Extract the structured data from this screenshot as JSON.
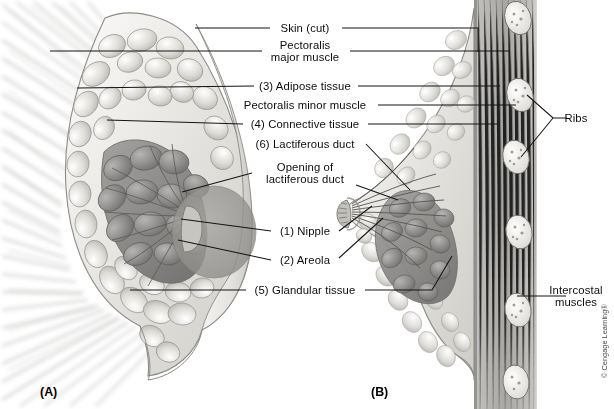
{
  "figure": {
    "copyright": "© Cengage Learning®"
  },
  "panels": [
    {
      "id": "A",
      "caption": "(A)",
      "view": "anterior-dissection",
      "x": 40,
      "y": 385
    },
    {
      "id": "B",
      "caption": "(B)",
      "view": "sagittal-section",
      "x": 371,
      "y": 385
    }
  ],
  "labels": [
    {
      "key": "skin",
      "text": "Skin (cut)",
      "lines": [
        "Skin (cut)"
      ],
      "cx": 305,
      "cy": 28,
      "w": 64,
      "number": ""
    },
    {
      "key": "pectoralis_major",
      "text": "Pectoralis major muscle",
      "lines": [
        "Pectoralis",
        "major muscle"
      ],
      "cx": 305,
      "cy": 51,
      "w": 84,
      "number": ""
    },
    {
      "key": "adipose",
      "text": "(3) Adipose tissue",
      "lines": [
        "(3) Adipose tissue"
      ],
      "cx": 305,
      "cy": 86,
      "w": 102,
      "number": "3"
    },
    {
      "key": "pectoralis_minor",
      "text": "Pectoralis minor muscle",
      "lines": [
        "Pectoralis minor muscle"
      ],
      "cx": 305,
      "cy": 105,
      "w": 140,
      "number": ""
    },
    {
      "key": "connective",
      "text": "(4) Connective tissue",
      "lines": [
        "(4) Connective tissue"
      ],
      "cx": 305,
      "cy": 124,
      "w": 124,
      "number": "4"
    },
    {
      "key": "lactiferous_duct",
      "text": "(6) Lactiferous duct",
      "lines": [
        "(6) Lactiferous duct"
      ],
      "cx": 305,
      "cy": 144,
      "w": 118,
      "number": "6"
    },
    {
      "key": "duct_opening",
      "text": "Opening of lactiferous duct",
      "lines": [
        "Opening of",
        "lactiferous duct"
      ],
      "cx": 305,
      "cy": 173,
      "w": 98,
      "number": ""
    },
    {
      "key": "nipple",
      "text": "(1) Nipple",
      "lines": [
        "(1) Nipple"
      ],
      "cx": 305,
      "cy": 231,
      "w": 62,
      "number": "1"
    },
    {
      "key": "areola",
      "text": "(2) Areola",
      "lines": [
        "(2) Areola"
      ],
      "cx": 305,
      "cy": 260,
      "w": 62,
      "number": "2"
    },
    {
      "key": "glandular",
      "text": "(5) Glandular tissue",
      "lines": [
        "(5) Glandular tissue"
      ],
      "cx": 305,
      "cy": 290,
      "w": 116,
      "number": "5"
    },
    {
      "key": "ribs",
      "text": "Ribs",
      "lines": [
        "Ribs"
      ],
      "cx": 576,
      "cy": 118,
      "w": 28,
      "number": ""
    },
    {
      "key": "intercostal",
      "text": "Intercostal muscles",
      "lines": [
        "Intercostal",
        "muscles"
      ],
      "cx": 576,
      "cy": 296,
      "w": 58,
      "number": ""
    }
  ],
  "leaders": [
    {
      "label": "skin",
      "side": "left",
      "path": "M 195,28 L 270,28"
    },
    {
      "label": "skin",
      "side": "right",
      "path": "M 342,28 L 478,28 L 478,52"
    },
    {
      "label": "pectoralis_major",
      "side": "left",
      "path": "M 195,51 L 262,51 M 50,51 L 195,51"
    },
    {
      "label": "pectoralis_major",
      "side": "right",
      "path": "M 350,51 L 510,51"
    },
    {
      "label": "adipose",
      "side": "left",
      "path": "M 77,88 L 254,86"
    },
    {
      "label": "adipose",
      "side": "right",
      "path": "M 358,86 L 500,86"
    },
    {
      "label": "pectoralis_minor",
      "side": "right",
      "path": "M 378,105 L 516,105"
    },
    {
      "label": "connective",
      "side": "left",
      "path": "M 107,120 L 243,124"
    },
    {
      "label": "connective",
      "side": "right",
      "path": "M 368,124 L 498,124"
    },
    {
      "label": "lactiferous_duct",
      "side": "right",
      "path": "M 366,144 L 410,190"
    },
    {
      "label": "duct_opening",
      "side": "left",
      "path": "M 182,192 L 252,173"
    },
    {
      "label": "duct_opening",
      "side": "right",
      "path": "M 356,185 L 398,200"
    },
    {
      "label": "nipple",
      "side": "left",
      "path": "M 181,219 L 271,231"
    },
    {
      "label": "nipple",
      "side": "right",
      "path": "M 339,231 L 372,206"
    },
    {
      "label": "areola",
      "side": "left",
      "path": "M 178,240 L 271,260"
    },
    {
      "label": "areola",
      "side": "right",
      "path": "M 339,258 L 383,218"
    },
    {
      "label": "glandular",
      "side": "left",
      "path": "M 130,290 L 246,290"
    },
    {
      "label": "glandular",
      "side": "right",
      "path": "M 365,290 L 432,290 L 452,256"
    },
    {
      "label": "ribs",
      "side": "left",
      "path": "M 567,118 L 553,118 L 527,95 M 553,118 L 521,157"
    },
    {
      "label": "intercostal",
      "side": "left",
      "path": "M 566,296 L 517,296"
    }
  ],
  "anatomy_notes": {
    "panel_a": "Frontal view: pectoral muscle striations radiate from left edge; lobulated adipose tissue ring surrounds darker glandular lobes converging on the nipple and areola.",
    "panel_b": "Lateral sagittal view: chest wall with rib cross-sections and intercostal muscles at right; lactiferous ducts converge at the nipple.",
    "palette": {
      "ink": "#111111",
      "leader": "#1a1a1a",
      "fat_light": "#f0efed",
      "fat_mid": "#d8d6d2",
      "gland_dark": "#8d8d8c",
      "muscle": "#a9a8a6",
      "bone_fill": "#efeeec",
      "background": "#ffffff"
    }
  }
}
